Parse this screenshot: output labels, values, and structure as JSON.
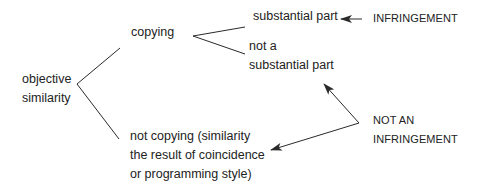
{
  "diagram": {
    "nodes": {
      "objective_similarity": [
        "objective",
        "similarity"
      ],
      "copying": "copying",
      "substantial_part": "substantial part",
      "not_substantial_part": [
        "not a",
        "substantial part"
      ],
      "not_copying": [
        "not copying (similarity",
        "the result of coincidence",
        "or programming style)"
      ],
      "infringement": "INFRINGEMENT",
      "not_an_infringement": [
        "NOT AN",
        "INFRINGEMENT"
      ]
    },
    "colors": {
      "line": "#2a2a2a",
      "text": "#222222",
      "background": "#ffffff"
    }
  }
}
